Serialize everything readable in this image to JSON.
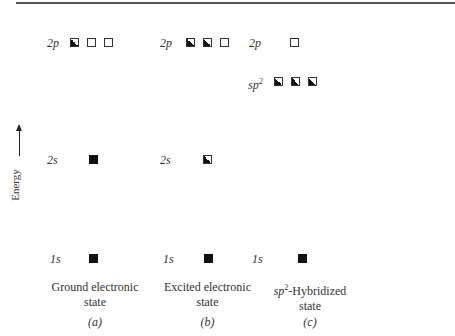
{
  "axis": {
    "label": "Energy"
  },
  "panels": [
    {
      "id": "a",
      "caption_line1": "Ground electronic",
      "caption_line2": "state",
      "sublabel": "(a)",
      "levels": [
        {
          "label": "2p",
          "orbitals": [
            "half",
            "empty",
            "empty"
          ]
        },
        {
          "label": "2s",
          "orbitals": [
            "full"
          ]
        },
        {
          "label": "1s",
          "orbitals": [
            "full"
          ]
        }
      ]
    },
    {
      "id": "b",
      "caption_line1": "Excited electronic",
      "caption_line2": "state",
      "sublabel": "(b)",
      "levels": [
        {
          "label": "2p",
          "orbitals": [
            "half",
            "half",
            "empty"
          ]
        },
        {
          "label": "2s",
          "orbitals": [
            "half"
          ]
        },
        {
          "label": "1s",
          "orbitals": [
            "full"
          ]
        }
      ]
    },
    {
      "id": "c",
      "caption_line1_prefix": "sp",
      "caption_line1_sup": "2",
      "caption_line1": "-Hybridized",
      "caption_line2": "state",
      "sublabel": "(c)",
      "levels": [
        {
          "label": "2p",
          "orbitals": [
            "empty"
          ]
        },
        {
          "label_prefix": "sp",
          "label_sup": "2",
          "orbitals": [
            "half",
            "half",
            "half"
          ]
        },
        {
          "label": "1s",
          "orbitals": [
            "full"
          ]
        }
      ]
    }
  ]
}
